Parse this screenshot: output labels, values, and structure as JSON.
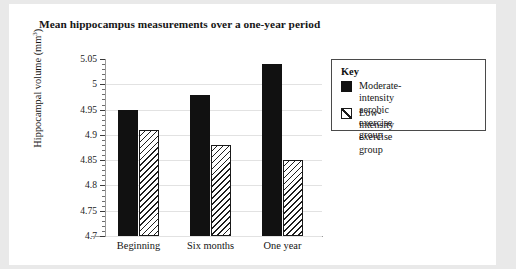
{
  "chart_data": {
    "type": "bar",
    "title": "Mean hippocampus measurements over a one-year period",
    "xlabel": "",
    "ylabel": "Hippocampal volume (mm³)",
    "categories": [
      "Beginning",
      "Six months",
      "One year"
    ],
    "ylim": [
      4.7,
      5.05
    ],
    "ytick_labels": [
      "4.7",
      "4.75",
      "4.8",
      "4.85",
      "4.9",
      "4.95",
      "5",
      "5.05"
    ],
    "ytick_values": [
      4.7,
      4.75,
      4.8,
      4.85,
      4.9,
      4.95,
      5.0,
      5.05
    ],
    "grid": true,
    "legend_position": "right",
    "legend_title": "Key",
    "series": [
      {
        "name": "Moderate-intensity aerobic exercise group",
        "fill": "solid-black",
        "values": [
          4.95,
          4.978,
          5.04
        ]
      },
      {
        "name": "Low-intensity exercise group",
        "fill": "diagonal-hatch",
        "values": [
          4.91,
          4.88,
          4.85
        ]
      }
    ]
  },
  "colors": {
    "page_background": "#e9e9e9",
    "card_background": "#ffffff",
    "series_solid": "#111111",
    "series_hatch_line": "#1e1e1e",
    "gridline": "#e2e2e2",
    "axis": "#9a9a9a",
    "text": "#141414",
    "legend_border": "#4a4a4a"
  },
  "axis": {
    "y_title_main": "Hippocampal volume (mm",
    "y_title_sup": "3",
    "y_title_close": ")"
  },
  "legend": {
    "title": "Key",
    "items": [
      {
        "label": "Moderate-intensity\naerobic exercise group",
        "swatch": "solid-black-square-icon"
      },
      {
        "label": "Low-intensity exercise group",
        "swatch": "hatched-square-icon"
      }
    ]
  }
}
